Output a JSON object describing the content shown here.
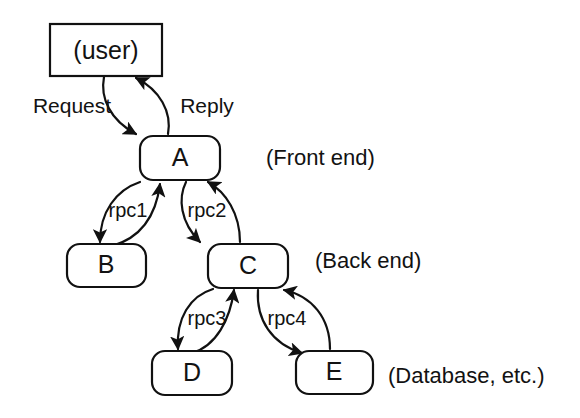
{
  "diagram": {
    "background_color": "#ffffff",
    "stroke_color": "#111111",
    "text_color": "#121212",
    "nodes": [
      {
        "id": "user",
        "label": "(user)",
        "shape": "rectangle",
        "x": 50,
        "y": 24,
        "w": 112,
        "h": 52
      },
      {
        "id": "A",
        "label": "A",
        "shape": "rounded-rectangle",
        "x": 140,
        "y": 136,
        "w": 80,
        "h": 44
      },
      {
        "id": "B",
        "label": "B",
        "shape": "rounded-rectangle",
        "x": 67,
        "y": 244,
        "w": 79,
        "h": 43
      },
      {
        "id": "C",
        "label": "C",
        "shape": "rounded-rectangle",
        "x": 208,
        "y": 244,
        "w": 80,
        "h": 44
      },
      {
        "id": "D",
        "label": "D",
        "shape": "rounded-rectangle",
        "x": 152,
        "y": 351,
        "w": 80,
        "h": 44
      },
      {
        "id": "E",
        "label": "E",
        "shape": "rounded-rectangle",
        "x": 296,
        "y": 351,
        "w": 77,
        "h": 43
      }
    ],
    "edge_labels": [
      {
        "id": "request",
        "text": "Request",
        "x": 72,
        "y": 107
      },
      {
        "id": "reply",
        "text": "Reply",
        "x": 207,
        "y": 107
      },
      {
        "id": "rpc1",
        "text": "rpc1",
        "x": 128,
        "y": 212
      },
      {
        "id": "rpc2",
        "text": "rpc2",
        "x": 207,
        "y": 212
      },
      {
        "id": "rpc3",
        "text": "rpc3",
        "x": 207,
        "y": 320
      },
      {
        "id": "rpc4",
        "text": "rpc4",
        "x": 287,
        "y": 320
      }
    ],
    "edges": [
      {
        "id": "user-to-A",
        "from": "user",
        "to": "A",
        "label": "Request",
        "direction": "down"
      },
      {
        "id": "A-to-user",
        "from": "A",
        "to": "user",
        "label": "Reply",
        "direction": "up"
      },
      {
        "id": "A-to-B",
        "from": "A",
        "to": "B",
        "label": "rpc1",
        "direction": "down"
      },
      {
        "id": "B-to-A",
        "from": "B",
        "to": "A",
        "label": "rpc1",
        "direction": "up"
      },
      {
        "id": "A-to-C",
        "from": "A",
        "to": "C",
        "label": "rpc2",
        "direction": "down"
      },
      {
        "id": "C-to-A",
        "from": "C",
        "to": "A",
        "label": "rpc2",
        "direction": "up"
      },
      {
        "id": "C-to-D",
        "from": "C",
        "to": "D",
        "label": "rpc3",
        "direction": "down"
      },
      {
        "id": "D-to-C",
        "from": "D",
        "to": "C",
        "label": "rpc3",
        "direction": "up"
      },
      {
        "id": "C-to-E",
        "from": "C",
        "to": "E",
        "label": "rpc4",
        "direction": "down"
      },
      {
        "id": "E-to-C",
        "from": "E",
        "to": "C",
        "label": "rpc4",
        "direction": "up"
      }
    ],
    "tier_labels": [
      {
        "id": "front-end",
        "text": "(Front end)",
        "x": 266,
        "y": 159
      },
      {
        "id": "back-end",
        "text": "(Back end)",
        "x": 315,
        "y": 262
      },
      {
        "id": "database",
        "text": "(Database, etc.)",
        "x": 388,
        "y": 377
      }
    ]
  }
}
